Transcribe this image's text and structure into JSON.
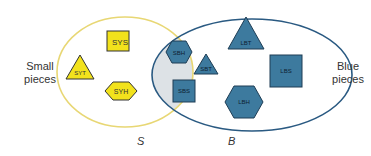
{
  "labels": {
    "left": [
      "Small",
      "pieces"
    ],
    "right": [
      "Blue",
      "pieces"
    ],
    "set_s": "S",
    "set_b": "B"
  },
  "pieces": {
    "sys": "SYS",
    "syt": "SYT",
    "syh": "SYH",
    "sbh": "SBH",
    "sbt": "SBT",
    "sbs": "SBS",
    "lbt": "LBT",
    "lbs": "LBS",
    "lbh": "LBH"
  },
  "colors": {
    "yellow": "#f2e21c",
    "yellow_stroke": "#e8d774",
    "blue": "#3d7a9e",
    "blue_stroke": "#2a5a82",
    "intersection": "#dde2e6"
  }
}
